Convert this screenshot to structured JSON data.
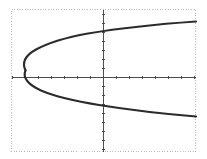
{
  "figure": {
    "name": "sideways-parabola-graph",
    "background_color": "#ffffff",
    "frame": {
      "style": "dotted",
      "color": "#b9b9b9",
      "x": 11,
      "y": 9,
      "width": 185,
      "height": 143
    },
    "axis_color": "#4d4d4d",
    "curve_color": "#2b2b2b",
    "curve_width": 2.1
  },
  "chart_data": {
    "type": "line",
    "title": "",
    "subtitle": "",
    "xlabel": "",
    "ylabel": "",
    "grid": false,
    "legend": null,
    "annotations": [],
    "axes": {
      "x_axis_pixel_y": 77,
      "y_axis_pixel_x": 103,
      "x_tick_spacing_px": 13,
      "y_tick_spacing_px": 9,
      "x_tick_length_px": 3,
      "y_tick_length_px": 3,
      "xlim": [
        -7.1,
        7.2
      ],
      "ylim": [
        -7.6,
        7.6
      ],
      "x_tick_labels": [],
      "y_tick_labels": []
    },
    "equation": "x = a*(y - k)^2 + h",
    "vertex": [
      -6.0,
      0.8
    ],
    "opens": "right",
    "series": [
      {
        "name": "upper-branch",
        "x": [
          -6.0,
          -5.8,
          -5.4,
          -4.8,
          -4.0,
          -3.0,
          -1.8,
          -0.4,
          1.2,
          3.0,
          4.8,
          6.6,
          7.2
        ],
        "y": [
          0.8,
          1.4,
          2.0,
          2.6,
          3.1,
          3.6,
          4.1,
          4.5,
          4.9,
          5.2,
          5.5,
          5.7,
          5.8
        ]
      },
      {
        "name": "lower-branch",
        "x": [
          -6.0,
          -5.8,
          -5.4,
          -4.8,
          -4.0,
          -3.0,
          -1.8,
          -0.4,
          1.2,
          3.0,
          4.8,
          6.6,
          7.2
        ],
        "y": [
          0.8,
          0.2,
          -0.4,
          -1.0,
          -1.5,
          -2.0,
          -2.5,
          -2.9,
          -3.3,
          -3.6,
          -3.9,
          -4.1,
          -4.2
        ]
      }
    ],
    "pixel_path": {
      "upper": "M 25.5,70.5 C 21.5,62 26,55 36,49.5 C 48,43 66,37.5 88,33.5 C 118,28.5 160,24 196,21.5",
      "lower": "M 25.5,70.5 C 22,78 29,85 41,90.5 C 55,96.5 74,101 99,105 C 130,110 165,114 196,116.5"
    }
  }
}
